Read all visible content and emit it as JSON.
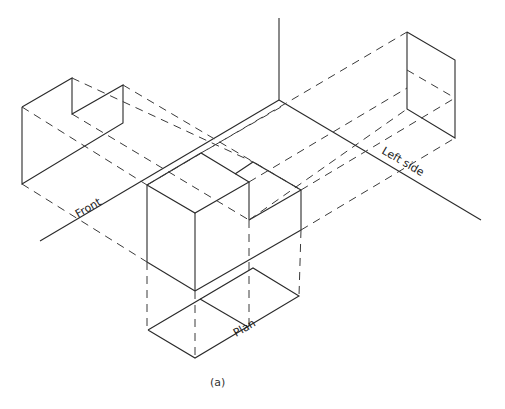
{
  "figure": {
    "caption": "(a)",
    "labels": {
      "front": "Front",
      "left_side": "Left side",
      "plan": "Plan"
    }
  },
  "colors": {
    "line": "#2a2a2a",
    "background": "#ffffff"
  }
}
